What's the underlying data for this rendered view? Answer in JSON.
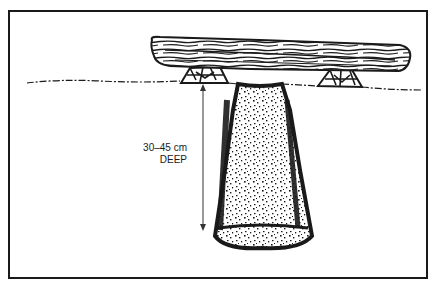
{
  "diagram": {
    "depth_label_line1": "30–45 cm",
    "depth_label_line2": "DEEP",
    "elements": [
      "log-seat",
      "stone-support-left",
      "stone-support-right",
      "ground-line",
      "latrine-pit",
      "depth-arrow"
    ],
    "colors": {
      "ink": "#1a1a1a",
      "paper": "#ffffff"
    }
  }
}
